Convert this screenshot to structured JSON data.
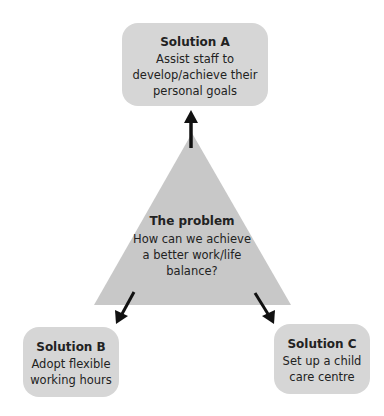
{
  "diagram": {
    "problem": {
      "title": "The problem",
      "lines": [
        "How can we achieve",
        "a better work/life",
        "balance?"
      ]
    },
    "solutions": [
      {
        "id": "A",
        "title": "Solution A",
        "lines": [
          "Assist staff to",
          "develop/achieve their",
          "personal goals"
        ]
      },
      {
        "id": "B",
        "title": "Solution B",
        "lines": [
          "Adopt flexible",
          "working hours"
        ]
      },
      {
        "id": "C",
        "title": "Solution C",
        "lines": [
          "Set up a child",
          "care centre"
        ]
      }
    ],
    "colors": {
      "shape_fill": "#c8c8c8",
      "box_fill": "#d6d6d6",
      "arrow": "#111111"
    }
  }
}
